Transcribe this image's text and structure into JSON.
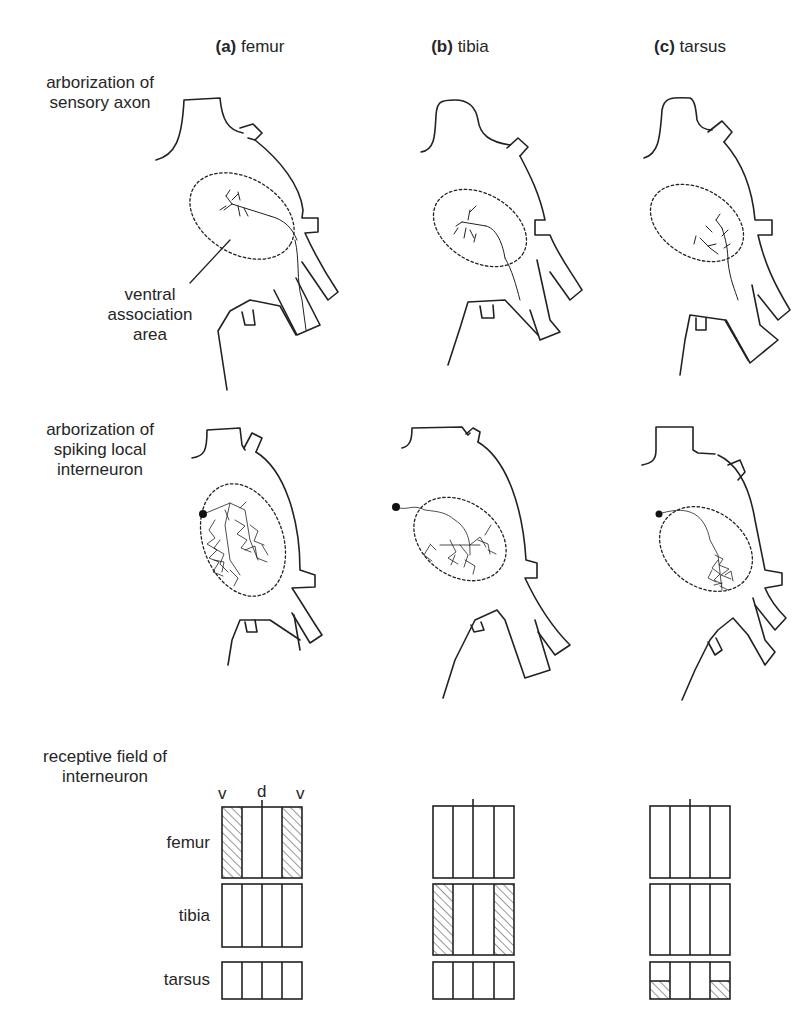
{
  "columns": [
    {
      "letter": "(a)",
      "name": "femur"
    },
    {
      "letter": "(b)",
      "name": "tibia"
    },
    {
      "letter": "(c)",
      "name": "tarsus"
    }
  ],
  "row_labels": {
    "sensory": {
      "line1": "arborization of",
      "line2": "sensory axon"
    },
    "interneuron": {
      "line1": "arborization of",
      "line2": "spiking local",
      "line3": "interneuron"
    },
    "receptive": {
      "line1": "receptive field of",
      "line2": "interneuron"
    }
  },
  "annotation": {
    "line1": "ventral",
    "line2": "association",
    "line3": "area"
  },
  "receptive_field": {
    "axis_labels": [
      "v",
      "d",
      "v"
    ],
    "segments": [
      "femur",
      "tibia",
      "tarsus"
    ],
    "shading": {
      "femur_column": {
        "femur": "outer-strips",
        "tibia": "none",
        "tarsus": "none"
      },
      "tibia_column": {
        "femur": "none",
        "tibia": "outer-strips",
        "tarsus": "none"
      },
      "tarsus_column": {
        "femur": "none",
        "tibia": "none",
        "tarsus": "outer-strips-lower-half"
      }
    }
  }
}
